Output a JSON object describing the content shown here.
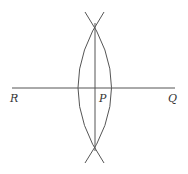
{
  "diagram": {
    "labels": {
      "R": "R",
      "P": "P",
      "Q": "Q"
    },
    "colors": {
      "line": "#555555",
      "text": "#333333",
      "background": "#ffffff"
    }
  }
}
